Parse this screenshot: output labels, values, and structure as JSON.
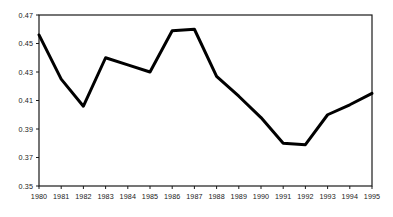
{
  "chart_data": {
    "type": "line",
    "title": "",
    "subtitle": "",
    "xlabel": "",
    "ylabel": "",
    "x": [
      1980,
      1981,
      1982,
      1983,
      1984,
      1985,
      1986,
      1987,
      1988,
      1989,
      1990,
      1991,
      1992,
      1993,
      1994,
      1995
    ],
    "categories": [
      "1980",
      "1981",
      "1982",
      "1983",
      "1984",
      "1985",
      "1986",
      "1987",
      "1988",
      "1989",
      "1990",
      "1991",
      "1992",
      "1993",
      "1994",
      "1995"
    ],
    "values": [
      0.456,
      0.425,
      0.406,
      0.44,
      0.435,
      0.43,
      0.459,
      0.46,
      0.427,
      0.413,
      0.398,
      0.38,
      0.379,
      0.4,
      0.407,
      0.415
    ],
    "series": [
      {
        "name": "series-1",
        "color": "#000000",
        "line_width": 3,
        "values": [
          0.456,
          0.425,
          0.406,
          0.44,
          0.435,
          0.43,
          0.459,
          0.46,
          0.427,
          0.413,
          0.398,
          0.38,
          0.379,
          0.4,
          0.407,
          0.415
        ]
      }
    ],
    "xlim": [
      1980,
      1995
    ],
    "ylim": [
      0.35,
      0.47
    ],
    "yticks": [
      0.35,
      0.37,
      0.39,
      0.41,
      0.43,
      0.45,
      0.47
    ],
    "ytick_labels": [
      "0.35",
      "0.37",
      "0.39",
      "0.41",
      "0.43",
      "0.45",
      "0.47"
    ],
    "xticks": [
      1980,
      1981,
      1982,
      1983,
      1984,
      1985,
      1986,
      1987,
      1988,
      1989,
      1990,
      1991,
      1992,
      1993,
      1994,
      1995
    ],
    "xtick_labels": [
      "1980",
      "1981",
      "1982",
      "1983",
      "1984",
      "1985",
      "1986",
      "1987",
      "1988",
      "1989",
      "1990",
      "1991",
      "1992",
      "1993",
      "1994",
      "1995"
    ],
    "grid": false,
    "legend": false,
    "legend_position": "none",
    "frame": true,
    "frame_color": "#1a1a1a",
    "background": "#ffffff",
    "annotations": []
  }
}
